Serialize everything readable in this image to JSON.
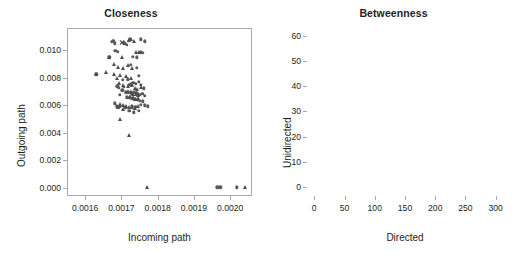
{
  "figure": {
    "panels": [
      "closeness",
      "betweenness"
    ]
  },
  "chart_data": [
    {
      "type": "scatter",
      "title": "Closeness",
      "xlabel": "Incoming path",
      "ylabel": "Outgoing path",
      "xlim": [
        0.00155,
        0.00206
      ],
      "ylim": [
        -0.0006,
        0.0116
      ],
      "xticks": [
        0.0016,
        0.0017,
        0.0018,
        0.0019,
        0.002
      ],
      "xticklabels": [
        "0.0016",
        "0.0017",
        "0.0018",
        "0.0019",
        "0.0020"
      ],
      "yticks": [
        0.0,
        0.002,
        0.004,
        0.006,
        0.008,
        0.01
      ],
      "yticklabels": [
        "0.000",
        "0.002",
        "0.004",
        "0.006",
        "0.008",
        "0.010"
      ],
      "grid": false,
      "legend": "none",
      "series": [
        {
          "name": "circle",
          "marker": "circle",
          "points": [
            [
              0.0016705,
              0.01065
            ],
            [
              0.0016745,
              0.01075
            ],
            [
              0.0016795,
              0.01055
            ],
            [
              0.0017055,
              0.01055
            ],
            [
              0.0017115,
              0.01045
            ],
            [
              0.0017175,
              0.01075
            ],
            [
              0.0017205,
              0.01085
            ],
            [
              0.0017505,
              0.01085
            ],
            [
              0.0017615,
              0.0107
            ],
            [
              0.0016805,
              0.01
            ],
            [
              0.0016865,
              0.00995
            ],
            [
              0.0017285,
              0.0096
            ],
            [
              0.0017405,
              0.00955
            ],
            [
              0.0017455,
              0.00985
            ],
            [
              0.0017515,
              0.0099
            ],
            [
              0.0017565,
              0.00985
            ],
            [
              0.0016635,
              0.00955
            ],
            [
              0.0017235,
              0.009
            ],
            [
              0.0017395,
              0.0088
            ],
            [
              0.0017455,
              0.0082
            ],
            [
              0.0016275,
              0.0083
            ],
            [
              0.0017005,
              0.0079
            ],
            [
              0.0017145,
              0.00795
            ],
            [
              0.0016855,
              0.00745
            ],
            [
              0.0016905,
              0.00735
            ],
            [
              0.0017035,
              0.0074
            ],
            [
              0.0017185,
              0.00755
            ],
            [
              0.0017245,
              0.0076
            ],
            [
              0.0017305,
              0.0077
            ],
            [
              0.0017375,
              0.0076
            ],
            [
              0.0017445,
              0.00775
            ],
            [
              0.0017505,
              0.00755
            ],
            [
              0.0017595,
              0.0073
            ],
            [
              0.0016995,
              0.00715
            ],
            [
              0.0017085,
              0.007
            ],
            [
              0.0017155,
              0.00695
            ],
            [
              0.0017225,
              0.00705
            ],
            [
              0.0017265,
              0.0069
            ],
            [
              0.0017315,
              0.007
            ],
            [
              0.0017385,
              0.00695
            ],
            [
              0.0017425,
              0.00685
            ],
            [
              0.0017485,
              0.0068
            ],
            [
              0.0017545,
              0.0069
            ],
            [
              0.0017615,
              0.00675
            ],
            [
              0.0016935,
              0.0068
            ],
            [
              0.0017115,
              0.00665
            ],
            [
              0.0017195,
              0.0066
            ],
            [
              0.0017275,
              0.00655
            ],
            [
              0.0017345,
              0.0065
            ],
            [
              0.0017415,
              0.00645
            ],
            [
              0.0017475,
              0.0064
            ],
            [
              0.0017555,
              0.00635
            ],
            [
              0.0016785,
              0.0062
            ],
            [
              0.0016845,
              0.006
            ],
            [
              0.0016915,
              0.00595
            ],
            [
              0.0017075,
              0.0059
            ],
            [
              0.0017265,
              0.006
            ],
            [
              0.0017355,
              0.00595
            ],
            [
              0.0017505,
              0.0061
            ],
            [
              0.0017615,
              0.00605
            ],
            [
              0.0017705,
              0.006
            ],
            [
              0.0017185,
              0.00565
            ],
            [
              0.0017315,
              0.00555
            ],
            [
              0.0017455,
              0.00565
            ],
            [
              0.0019615,
              0.0001
            ],
            [
              0.0019695,
              0.0001
            ],
            [
              0.0020145,
              0.0001
            ]
          ]
        },
        {
          "name": "triangle",
          "marker": "triangle",
          "points": [
            [
              0.0017185,
              0.0108
            ],
            [
              0.0017245,
              0.01085
            ],
            [
              0.0017315,
              0.01075
            ],
            [
              0.0017385,
              0.0099
            ],
            [
              0.0017445,
              0.00995
            ],
            [
              0.0016975,
              0.0096
            ],
            [
              0.0016635,
              0.00955
            ],
            [
              0.0016775,
              0.00905
            ],
            [
              0.0016875,
              0.00885
            ],
            [
              0.0017015,
              0.0088
            ],
            [
              0.0017155,
              0.00895
            ],
            [
              0.0017275,
              0.0088
            ],
            [
              0.0016545,
              0.00845
            ],
            [
              0.0016765,
              0.00835
            ],
            [
              0.0016855,
              0.00805
            ],
            [
              0.0016935,
              0.00825
            ],
            [
              0.0017095,
              0.0082
            ],
            [
              0.0017235,
              0.00805
            ],
            [
              0.0016265,
              0.0083
            ],
            [
              0.0016905,
              0.00765
            ],
            [
              0.0017025,
              0.00755
            ],
            [
              0.0017165,
              0.00745
            ],
            [
              0.0017255,
              0.0075
            ],
            [
              0.0017345,
              0.00735
            ],
            [
              0.0017415,
              0.00725
            ],
            [
              0.0017505,
              0.0074
            ],
            [
              0.0017165,
              0.0071
            ],
            [
              0.0017245,
              0.007
            ],
            [
              0.0017305,
              0.0069
            ],
            [
              0.0017365,
              0.00685
            ],
            [
              0.0017425,
              0.0068
            ],
            [
              0.0017205,
              0.0067
            ],
            [
              0.0017285,
              0.00665
            ],
            [
              0.0017355,
              0.00655
            ],
            [
              0.0017435,
              0.0066
            ],
            [
              0.0016935,
              0.00615
            ],
            [
              0.0017025,
              0.00605
            ],
            [
              0.0017105,
              0.006
            ],
            [
              0.0017185,
              0.00595
            ],
            [
              0.0017265,
              0.0059
            ],
            [
              0.0017345,
              0.00585
            ],
            [
              0.0017425,
              0.006
            ],
            [
              0.0016875,
              0.0059
            ],
            [
              0.0017015,
              0.0058
            ],
            [
              0.0016925,
              0.00505
            ],
            [
              0.0017195,
              0.0039
            ],
            [
              0.0017675,
              0.0001
            ],
            [
              0.0020375,
              0.0001
            ]
          ]
        },
        {
          "name": "cross",
          "marker": "x",
          "points": [
            [
              0.0016985,
              0.0106
            ]
          ]
        }
      ]
    },
    {
      "type": "scatter",
      "title": "Betweenness",
      "xlabel": "Directed",
      "ylabel": "Unidirected",
      "xlim": [
        -12,
        312
      ],
      "ylim": [
        -3.5,
        63
      ],
      "xticks": [
        0,
        50,
        100,
        150,
        200,
        250,
        300
      ],
      "xticklabels": [
        "0",
        "50",
        "100",
        "150",
        "200",
        "250",
        "300"
      ],
      "yticks": [
        0,
        10,
        20,
        30,
        40,
        50,
        60
      ],
      "yticklabels": [
        "0",
        "10",
        "20",
        "30",
        "40",
        "50",
        "60"
      ],
      "grid": false,
      "legend": "none",
      "series": [
        {
          "name": "circle",
          "marker": "circle",
          "points": [
            [
              291,
              60.2
            ],
            [
              207,
              57.8
            ],
            [
              232,
              42.2
            ],
            [
              121,
              45.8
            ],
            [
              144,
              44.8
            ],
            [
              71,
              42.5
            ],
            [
              79,
              40.4
            ],
            [
              65,
              32.5
            ],
            [
              72,
              29.8
            ],
            [
              45,
              36.4
            ],
            [
              45,
              35.8
            ],
            [
              78,
              30.3
            ],
            [
              75,
              24.6
            ],
            [
              68,
              22.4
            ],
            [
              62,
              20.8
            ],
            [
              72,
              18.4
            ],
            [
              55,
              17.6
            ],
            [
              46,
              13.5
            ],
            [
              56,
              13.6
            ],
            [
              62,
              13.3
            ],
            [
              66,
              12.8
            ],
            [
              72,
              13.0
            ],
            [
              80,
              13.0
            ],
            [
              34,
              12.0
            ],
            [
              13,
              11.8
            ],
            [
              35,
              10.6
            ],
            [
              43,
              10.2
            ],
            [
              41,
              9.6
            ],
            [
              45,
              8.8
            ],
            [
              38,
              8.2
            ],
            [
              33,
              7.4
            ],
            [
              30,
              6.8
            ],
            [
              27,
              6.2
            ],
            [
              25,
              5.6
            ],
            [
              23,
              5.2
            ],
            [
              21,
              4.8
            ],
            [
              19,
              4.4
            ],
            [
              17,
              4.0
            ],
            [
              15,
              3.6
            ],
            [
              13,
              3.2
            ],
            [
              11,
              2.8
            ],
            [
              10,
              2.4
            ],
            [
              8,
              2.1
            ],
            [
              7,
              1.8
            ],
            [
              6,
              1.5
            ],
            [
              5,
              1.2
            ],
            [
              4,
              1.0
            ],
            [
              3,
              0.8
            ],
            [
              3,
              2.6
            ],
            [
              5,
              3.1
            ],
            [
              7,
              3.6
            ],
            [
              9,
              4.1
            ],
            [
              12,
              4.6
            ],
            [
              16,
              5.2
            ],
            [
              20,
              5.9
            ],
            [
              24,
              6.4
            ],
            [
              28,
              7.0
            ]
          ]
        },
        {
          "name": "triangle",
          "marker": "triangle",
          "points": [
            [
              124,
              55.8
            ],
            [
              120,
              45.6
            ],
            [
              130,
              43.2
            ],
            [
              131,
              40.6
            ],
            [
              15,
              30.4
            ],
            [
              76,
              30.0
            ],
            [
              44,
              26.0
            ],
            [
              45,
              24.4
            ],
            [
              75,
              24.2
            ],
            [
              44,
              22.8
            ],
            [
              45,
              22.0
            ],
            [
              58,
              21.4
            ],
            [
              59,
              20.2
            ],
            [
              55,
              17.6
            ],
            [
              27,
              16.8
            ],
            [
              50,
              13.8
            ],
            [
              52,
              13.6
            ],
            [
              48,
              12.6
            ],
            [
              45,
              11.2
            ],
            [
              20,
              11.4
            ],
            [
              41,
              10.4
            ],
            [
              38,
              9.2
            ],
            [
              36,
              8.4
            ],
            [
              33,
              7.8
            ],
            [
              78,
              6.6
            ],
            [
              31,
              7.2
            ],
            [
              29,
              6.6
            ],
            [
              26,
              6.0
            ],
            [
              24,
              5.4
            ],
            [
              22,
              5.0
            ],
            [
              20,
              4.6
            ],
            [
              18,
              4.2
            ],
            [
              16,
              3.8
            ],
            [
              14,
              3.4
            ],
            [
              12,
              3.0
            ],
            [
              10,
              2.6
            ],
            [
              9,
              2.2
            ],
            [
              7,
              1.9
            ],
            [
              6,
              1.6
            ],
            [
              5,
              1.3
            ],
            [
              4,
              1.1
            ],
            [
              3,
              0.9
            ],
            [
              2,
              0.6
            ],
            [
              2,
              1.4
            ],
            [
              6,
              2.8
            ],
            [
              11,
              3.9
            ],
            [
              17,
              4.9
            ],
            [
              23,
              6.2
            ],
            [
              29,
              7.4
            ],
            [
              35,
              8.0
            ],
            [
              94,
              1.4
            ]
          ]
        },
        {
          "name": "cross",
          "marker": "x",
          "points": [
            [
              95,
              37.6
            ]
          ]
        }
      ]
    }
  ]
}
